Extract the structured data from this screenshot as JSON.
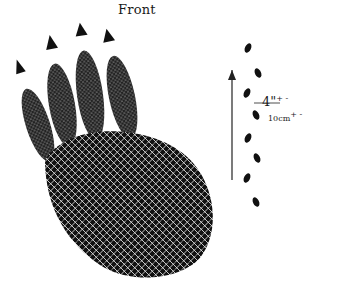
{
  "figure": {
    "title": "Front",
    "measurement": {
      "imperial": "4\"",
      "imperial_tolerance": "+ -",
      "metric": "10cm",
      "metric_tolerance": "+ -"
    },
    "subjects": [
      "front-paw-print",
      "trackway-pattern",
      "direction-arrow"
    ]
  },
  "colors": {
    "ink": "#1a1a1a",
    "paper": "#ffffff"
  }
}
